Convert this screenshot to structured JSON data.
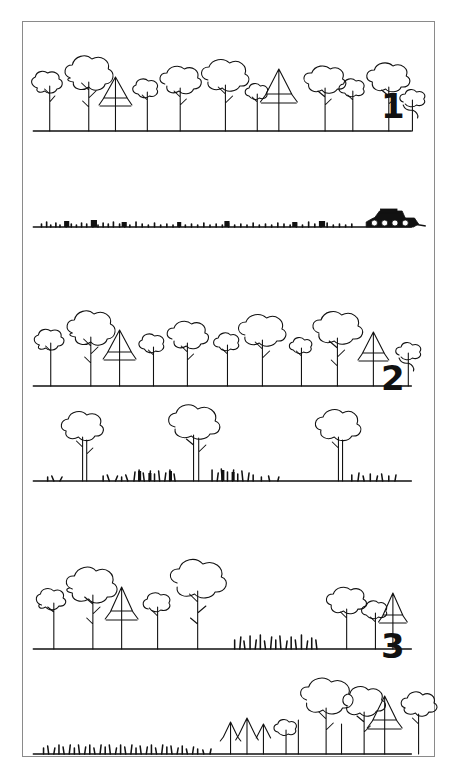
{
  "header": {
    "text": "",
    "note": "faint cut-off running head at very top of page, illegible"
  },
  "figure": {
    "frame_color": "#8a8a8a",
    "ink_color": "#111111",
    "background_color": "#ffffff",
    "panels": [
      {
        "number": "1",
        "name": "clear-cutting",
        "number_position": {
          "x": 380,
          "y": 88
        },
        "rows": [
          {
            "name": "intact-forest-row",
            "ground_y": 118,
            "description": "continuous closed-canopy forest, broadleaf and conifer crowns",
            "tree_count": 16,
            "grass": false,
            "vehicle": false
          },
          {
            "name": "cleared-ground-row",
            "ground_y": 205,
            "description": "bare cleared ground with stumps and slash debris, tracked vehicle at right",
            "tree_count": 0,
            "grass": false,
            "vehicle": true,
            "vehicle_name": "bulldozer",
            "vehicle_x": 345
          }
        ]
      },
      {
        "number": "2",
        "name": "selective-thinning",
        "number_position": {
          "x": 380,
          "y": 360
        },
        "rows": [
          {
            "name": "intact-forest-row",
            "ground_y": 372,
            "description": "continuous closed-canopy forest, broadleaf and conifer crowns",
            "tree_count": 16,
            "grass": false,
            "vehicle": false
          },
          {
            "name": "scattered-remnant-trees-row",
            "ground_y": 462,
            "description": "three isolated remnant trees over grass and low scrub",
            "tree_count": 3,
            "grass": true,
            "vehicle": false
          }
        ]
      },
      {
        "number": "3",
        "name": "patch-fragmentation",
        "number_position": {
          "x": 380,
          "y": 628
        },
        "rows": [
          {
            "name": "two-forest-patches-row",
            "ground_y": 640,
            "description": "forest patch at left, open grass gap in middle, conifer patch at right",
            "tree_count": 11,
            "grass": true,
            "vehicle": false
          },
          {
            "name": "grass-and-patch-row",
            "ground_y": 740,
            "description": "open grassland at left, dense forest patch at right",
            "tree_count": 11,
            "grass": true,
            "vehicle": false
          }
        ]
      }
    ]
  }
}
